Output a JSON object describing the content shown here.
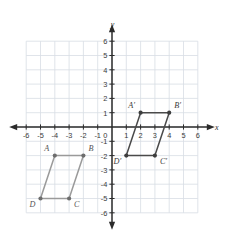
{
  "figure": {
    "type": "coordinate-plane-diagram",
    "axes": {
      "x_label": "x",
      "y_label": "y",
      "x_min": -6,
      "x_max": 6,
      "y_min": -6,
      "y_max": 6,
      "step": 1,
      "grid": true,
      "x_tick_labels": [
        "-6",
        "-5",
        "-4",
        "-3",
        "-2",
        "-1",
        "0",
        "1",
        "2",
        "3",
        "4",
        "5",
        "6"
      ],
      "y_tick_labels": [
        "6",
        "5",
        "4",
        "3",
        "2",
        "1",
        "0",
        "-1",
        "-2",
        "-3",
        "-4",
        "-5",
        "-6"
      ],
      "origin_label": "0",
      "arrows": [
        "left",
        "right",
        "up",
        "down"
      ]
    },
    "colors": {
      "grid": "#d8dde4",
      "axis": "#2b2b2b",
      "preimage_stroke": "#9a9a9a",
      "image_stroke": "#4a4a4a",
      "vertex_dot": "#6d6d6d",
      "image_vertex_dot": "#3d3d3d",
      "background": "#ffffff"
    },
    "shapes": [
      {
        "name": "preimage",
        "id": "ABCD",
        "stroke": "#9a9a9a",
        "vertices": [
          {
            "label": "A",
            "x": -4,
            "y": -2,
            "label_pos": "above-left"
          },
          {
            "label": "B",
            "x": -2,
            "y": -2,
            "label_pos": "above-right"
          },
          {
            "label": "C",
            "x": -3,
            "y": -5,
            "label_pos": "below-right"
          },
          {
            "label": "D",
            "x": -5,
            "y": -5,
            "label_pos": "below-left"
          }
        ]
      },
      {
        "name": "image",
        "id": "A'B'C'D'",
        "stroke": "#4a4a4a",
        "vertices": [
          {
            "label": "A'",
            "x": 2,
            "y": 1,
            "label_pos": "above-left"
          },
          {
            "label": "B'",
            "x": 4,
            "y": 1,
            "label_pos": "above-right"
          },
          {
            "label": "C'",
            "x": 3,
            "y": -2,
            "label_pos": "below-right"
          },
          {
            "label": "D'",
            "x": 1,
            "y": -2,
            "label_pos": "below-left"
          }
        ]
      }
    ]
  }
}
